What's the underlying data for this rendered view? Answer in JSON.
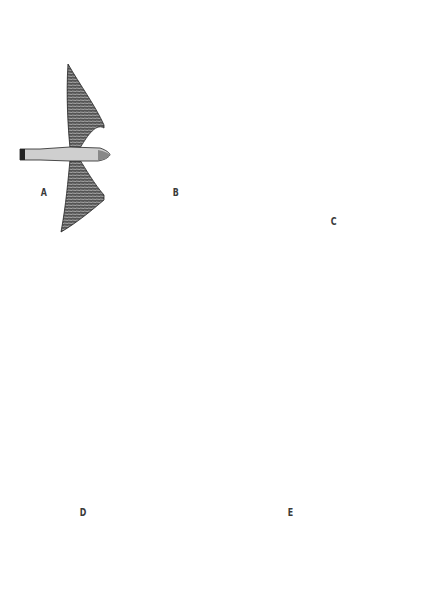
{
  "figure": {
    "birds": [
      {
        "label": "A",
        "tone": "light",
        "fill": "#6a6a6a"
      },
      {
        "label": "B",
        "tone": "dark",
        "fill": "#1e1e1e"
      },
      {
        "label": "C",
        "tone": "dark",
        "fill": "#141414"
      },
      {
        "label": "D",
        "tone": "patterned",
        "fill": "#3a3a3a"
      },
      {
        "label": "E",
        "tone": "light-streaked",
        "fill": "#7a7a7a"
      }
    ]
  }
}
